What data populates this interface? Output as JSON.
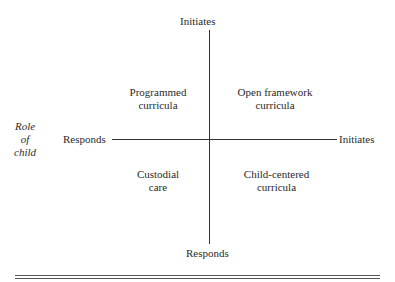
{
  "diagram": {
    "vertical_axis": {
      "top_label": "Initiates",
      "bottom_label": "Responds"
    },
    "horizontal_axis": {
      "title": [
        "Role",
        "of",
        "child"
      ],
      "left_label": "Responds",
      "right_label": "Initiates"
    },
    "quadrants": {
      "top_left": [
        "Programmed",
        "curricula"
      ],
      "top_right": [
        "Open framework",
        "curricula"
      ],
      "bottom_left": [
        "Custodial",
        "care"
      ],
      "bottom_right": [
        "Child-centered",
        "curricula"
      ]
    }
  }
}
